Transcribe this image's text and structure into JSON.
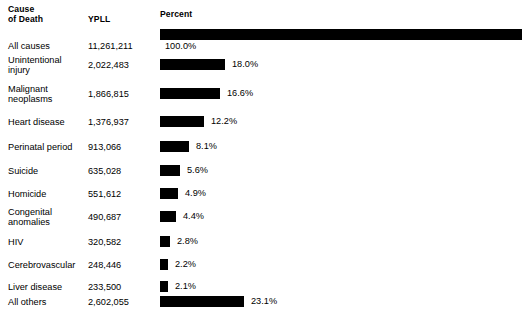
{
  "header": {
    "cause_line1": "Cause",
    "cause_line2": "of Death",
    "ypll": "YPLL",
    "percent": "Percent"
  },
  "chart_data": {
    "type": "bar",
    "orientation": "horizontal",
    "title": "",
    "xlabel": "Percent",
    "ylabel": "Cause of Death",
    "xlim": [
      0,
      100
    ],
    "grid": false,
    "legend": null,
    "columns": [
      "Cause of Death",
      "YPLL",
      "Percent"
    ],
    "categories": [
      "All causes",
      "Unintentional injury",
      "Malignant neoplasms",
      "Heart disease",
      "Perinatal period",
      "Suicide",
      "Homicide",
      "Congenital anomalies",
      "HIV",
      "Cerebrovascular",
      "Liver disease",
      "All others"
    ],
    "values": [
      100.0,
      18.0,
      16.6,
      12.2,
      8.1,
      5.6,
      4.9,
      4.4,
      2.8,
      2.2,
      2.1,
      23.1
    ],
    "ypll_values": [
      11261211,
      2022483,
      1866815,
      1376937,
      913066,
      635028,
      551612,
      490687,
      320582,
      248446,
      233500,
      2602055
    ],
    "bar_color": "#000000"
  },
  "rows": [
    {
      "cause_line1": "All causes",
      "cause_line2": "",
      "ypll": "11,261,211",
      "percent": "100.0%",
      "value": 100.0,
      "label_below": true
    },
    {
      "cause_line1": "Unintentional",
      "cause_line2": "injury",
      "ypll": "2,022,483",
      "percent": "18.0%",
      "value": 18.0,
      "label_below": false
    },
    {
      "cause_line1": "Malignant",
      "cause_line2": "neoplasms",
      "ypll": "1,866,815",
      "percent": "16.6%",
      "value": 16.6,
      "label_below": false
    },
    {
      "cause_line1": "Heart disease",
      "cause_line2": "",
      "ypll": "1,376,937",
      "percent": "12.2%",
      "value": 12.2,
      "label_below": false
    },
    {
      "cause_line1": "Perinatal period",
      "cause_line2": "",
      "ypll": "913,066",
      "percent": "8.1%",
      "value": 8.1,
      "label_below": false
    },
    {
      "cause_line1": "Suicide",
      "cause_line2": "",
      "ypll": "635,028",
      "percent": "5.6%",
      "value": 5.6,
      "label_below": false
    },
    {
      "cause_line1": "Homicide",
      "cause_line2": "",
      "ypll": "551,612",
      "percent": "4.9%",
      "value": 4.9,
      "label_below": false
    },
    {
      "cause_line1": "Congenital",
      "cause_line2": "anomalies",
      "ypll": "490,687",
      "percent": "4.4%",
      "value": 4.4,
      "label_below": false
    },
    {
      "cause_line1": "HIV",
      "cause_line2": "",
      "ypll": "320,582",
      "percent": "2.8%",
      "value": 2.8,
      "label_below": false
    },
    {
      "cause_line1": "Cerebrovascular",
      "cause_line2": "",
      "ypll": "248,446",
      "percent": "2.2%",
      "value": 2.2,
      "label_below": false
    },
    {
      "cause_line1": "Liver disease",
      "cause_line2": "",
      "ypll": "233,500",
      "percent": "2.1%",
      "value": 2.1,
      "label_below": false
    },
    {
      "cause_line1": "All others",
      "cause_line2": "",
      "ypll": "2,602,055",
      "percent": "23.1%",
      "value": 23.1,
      "label_below": false
    }
  ],
  "layout": {
    "bar_origin_x": 160,
    "bar_full_width": 362,
    "bar_height": 11
  }
}
